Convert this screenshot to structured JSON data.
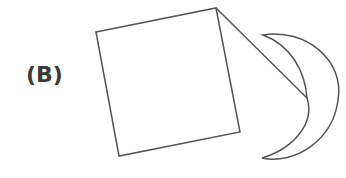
{
  "figure": {
    "label": "(B)",
    "shapes": [
      {
        "type": "square",
        "description": "tilted square",
        "corners": [
          [
            96,
            32
          ],
          [
            216,
            8
          ],
          [
            240,
            132
          ],
          [
            119,
            156
          ]
        ]
      },
      {
        "type": "line",
        "description": "line from square top-right corner to crescent inner edge",
        "from": [
          216,
          8
        ],
        "to": [
          307,
          98
        ]
      },
      {
        "type": "crescent",
        "description": "crescent moon shape opening left",
        "top_tip": [
          263,
          35
        ],
        "bottom_tip": [
          262,
          158
        ],
        "outer_right": [
          338,
          96
        ],
        "inner_right": [
          307,
          98
        ]
      }
    ],
    "stroke_color": "#555555"
  }
}
